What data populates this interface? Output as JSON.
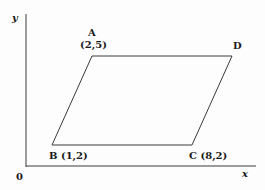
{
  "figure": {
    "type": "coordinate-geometry-diagram",
    "shape": "parallelogram",
    "axes": {
      "x_label": "x",
      "y_label": "y",
      "origin_label": "0"
    },
    "vertices": [
      {
        "name": "A",
        "coords": "(2,5)"
      },
      {
        "name": "B",
        "coords": "(1,2)"
      },
      {
        "name": "C",
        "coords": "(8,2)"
      },
      {
        "name": "D",
        "coords": ""
      }
    ],
    "labels": {
      "A_name": "A",
      "A_coords": "(2,5)",
      "B_label": "B (1,2)",
      "C_label": "C (8,2)",
      "D_name": "D"
    },
    "colors": {
      "line": "#3a3a3a",
      "text": "#1a1a1a",
      "background": "#fdfdfd"
    }
  }
}
